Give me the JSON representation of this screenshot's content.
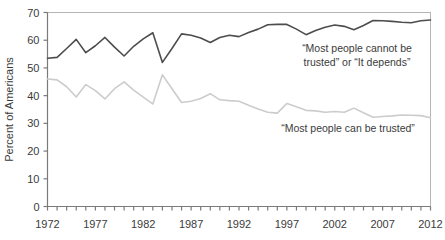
{
  "chart_data": {
    "type": "line",
    "title": "",
    "subtitle": "",
    "xlabel": "",
    "ylabel": "Percent of Americans",
    "xlim": [
      1972,
      2012
    ],
    "ylim": [
      0,
      70
    ],
    "grid": false,
    "legend_position": "inline-annotations",
    "y_ticks": [
      0,
      10,
      20,
      30,
      40,
      50,
      60,
      70
    ],
    "y_tick_labels": [
      "0",
      "10",
      "20",
      "30",
      "40",
      "50",
      "60",
      "70"
    ],
    "x_ticks": [
      1972,
      1973,
      1974,
      1975,
      1976,
      1977,
      1978,
      1979,
      1980,
      1981,
      1982,
      1983,
      1984,
      1985,
      1986,
      1987,
      1988,
      1989,
      1990,
      1991,
      1992,
      1993,
      1994,
      1995,
      1996,
      1997,
      1998,
      1999,
      2000,
      2001,
      2002,
      2003,
      2004,
      2005,
      2006,
      2007,
      2008,
      2009,
      2010,
      2011,
      2012
    ],
    "x_tick_labels": [
      "1972",
      "1977",
      "1982",
      "1987",
      "1992",
      "1997",
      "2002",
      "2007",
      "2012"
    ],
    "x_labeled_ticks": [
      1972,
      1977,
      1982,
      1987,
      1992,
      1997,
      2002,
      2007,
      2012
    ],
    "x": [
      1972,
      1973,
      1974,
      1975,
      1976,
      1977,
      1978,
      1979,
      1980,
      1981,
      1982,
      1983,
      1984,
      1985,
      1986,
      1987,
      1988,
      1989,
      1990,
      1991,
      1992,
      1993,
      1994,
      1995,
      1996,
      1997,
      1998,
      1999,
      2000,
      2001,
      2002,
      2003,
      2004,
      2005,
      2006,
      2007,
      2008,
      2009,
      2010,
      2011,
      2012
    ],
    "series": [
      {
        "name": "“Most people cannot be trusted” or “It depends”",
        "color": "#4d4d4d",
        "values": [
          53.5,
          53.8,
          57.0,
          60.3,
          55.5,
          58.0,
          61.0,
          57.5,
          54.3,
          57.8,
          60.5,
          62.7,
          52.0,
          57.0,
          62.3,
          61.8,
          60.8,
          59.2,
          61.0,
          61.8,
          61.3,
          62.8,
          64.0,
          65.6,
          65.7,
          65.7,
          64.0,
          62.0,
          63.5,
          64.7,
          65.5,
          65.0,
          63.8,
          65.3,
          67.1,
          67.0,
          66.8,
          66.5,
          66.3,
          67.0,
          67.3
        ]
      },
      {
        "name": "“Most people can be trusted”",
        "color": "#cccccc",
        "values": [
          46.0,
          45.7,
          43.2,
          39.5,
          44.0,
          41.8,
          38.8,
          42.5,
          45.0,
          42.0,
          39.5,
          37.0,
          47.5,
          42.5,
          37.5,
          38.0,
          39.0,
          40.7,
          38.5,
          38.2,
          38.0,
          36.5,
          35.2,
          34.0,
          33.7,
          37.2,
          36.0,
          34.7,
          34.5,
          34.0,
          34.3,
          34.0,
          35.5,
          33.8,
          32.2,
          32.5,
          32.7,
          33.0,
          32.9,
          32.8,
          32.0
        ]
      }
    ],
    "annotations": [
      {
        "name": "cannot-be-trusted-label",
        "lines": [
          "“Most people cannot be",
          "trusted” or “It depends”"
        ],
        "x_px": 357,
        "y_px": 52
      },
      {
        "name": "can-be-trusted-label",
        "lines": [
          "“Most people can be trusted”"
        ],
        "x_px": 348,
        "y_px": 132
      }
    ],
    "colors": {
      "line_dark": "#4d4d4d",
      "line_light": "#cccccc",
      "axis": "#7a7a7a",
      "text": "#3b3b3b",
      "background": "#ffffff"
    }
  }
}
